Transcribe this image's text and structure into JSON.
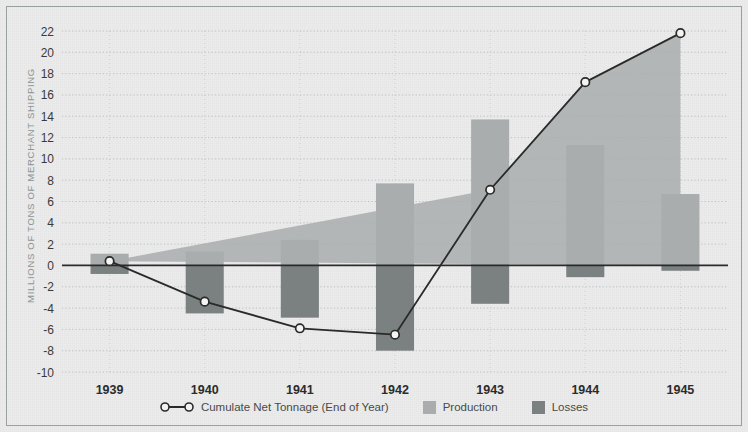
{
  "chart_data": {
    "type": "bar",
    "title": "",
    "subtitle": "",
    "xlabel": "",
    "ylabel": "MILLIONS OF TONS OF MERCHANT SHIPPING",
    "categories": [
      "1939",
      "1940",
      "1941",
      "1942",
      "1943",
      "1944",
      "1945"
    ],
    "ylim": [
      -10,
      22
    ],
    "ytick_step": 2,
    "yticks": [
      22,
      20,
      18,
      16,
      14,
      12,
      10,
      8,
      6,
      4,
      2,
      0,
      -2,
      -4,
      -6,
      -8,
      -10
    ],
    "grid": true,
    "grid_style": "dotted-horizontal",
    "legend_position": "bottom-center",
    "zero_line": 0,
    "series": [
      {
        "name": "Production",
        "type": "bar",
        "color": "#a9adad",
        "values": [
          1.1,
          1.3,
          2.4,
          7.7,
          13.7,
          11.3,
          6.7
        ]
      },
      {
        "name": "Losses",
        "type": "bar",
        "color": "#7b8080",
        "values": [
          -0.8,
          -4.5,
          -4.9,
          -8.0,
          -3.6,
          -1.1,
          -0.5
        ]
      },
      {
        "name": "Cumulate Net Tonnage (End of Year)",
        "type": "line",
        "color": "#2a2a2a",
        "marker": "circle-open",
        "values": [
          0.4,
          -3.4,
          -5.9,
          -6.5,
          7.1,
          17.2,
          21.8
        ]
      }
    ]
  },
  "legend": {
    "items": [
      {
        "label": "Cumulate Net Tonnage (End of Year)",
        "marker": "line-with-circles",
        "color": "#2a2a2a"
      },
      {
        "label": "Production",
        "marker": "swatch",
        "color": "#a9adad"
      },
      {
        "label": "Losses",
        "marker": "swatch",
        "color": "#7b8080"
      }
    ]
  },
  "axes": {
    "y_axis_title": "MILLIONS OF TONS OF MERCHANT SHIPPING",
    "y_tick_labels": [
      "22",
      "20",
      "18",
      "16",
      "14",
      "12",
      "10",
      "8",
      "6",
      "4",
      "2",
      "0",
      "-2",
      "-4",
      "-6",
      "-8",
      "-10"
    ],
    "x_tick_labels": [
      "1939",
      "1940",
      "1941",
      "1942",
      "1943",
      "1944",
      "1945"
    ]
  },
  "colors": {
    "background": "#ebeceb",
    "frame": "#9aa0a2",
    "grid": "#b9bec0",
    "production": "#a9adad",
    "losses": "#7b8080",
    "line": "#2a2a2a",
    "area_fill": "#a9adad",
    "tick_text": "#3a3a3a",
    "axis_label": "#8d9396"
  }
}
